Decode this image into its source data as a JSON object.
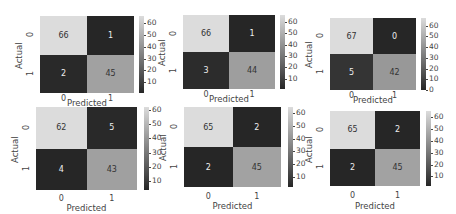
{
  "chart_data": [
    {
      "type": "heatmap",
      "title": "",
      "xlabel": "Predicted",
      "ylabel": "Actual",
      "x_ticks": [
        "0",
        "1"
      ],
      "y_ticks": [
        "0",
        "1"
      ],
      "values": [
        [
          66,
          1
        ],
        [
          2,
          45
        ]
      ],
      "colorbar_ticks": [
        "10",
        "20",
        "30",
        "40",
        "50",
        "60"
      ],
      "colorbar_range": [
        1,
        66
      ]
    },
    {
      "type": "heatmap",
      "title": "",
      "xlabel": "Predicted",
      "ylabel": "Actual",
      "x_ticks": [
        "0",
        "1"
      ],
      "y_ticks": [
        "0",
        "1"
      ],
      "values": [
        [
          66,
          1
        ],
        [
          3,
          44
        ]
      ],
      "colorbar_ticks": [
        "10",
        "20",
        "30",
        "40",
        "50",
        "60"
      ],
      "colorbar_range": [
        1,
        66
      ]
    },
    {
      "type": "heatmap",
      "title": "",
      "xlabel": "Predicted",
      "ylabel": "Actual",
      "x_ticks": [
        "0",
        "1"
      ],
      "y_ticks": [
        "0",
        "1"
      ],
      "values": [
        [
          67,
          0
        ],
        [
          5,
          42
        ]
      ],
      "colorbar_ticks": [
        "0",
        "10",
        "20",
        "30",
        "40",
        "50",
        "60"
      ],
      "colorbar_range": [
        0,
        67
      ]
    },
    {
      "type": "heatmap",
      "title": "",
      "xlabel": "Predicted",
      "ylabel": "Actual",
      "x_ticks": [
        "0",
        "1"
      ],
      "y_ticks": [
        "0",
        "1"
      ],
      "values": [
        [
          62,
          5
        ],
        [
          4,
          43
        ]
      ],
      "colorbar_ticks": [
        "10",
        "20",
        "30",
        "40",
        "50",
        "60"
      ],
      "colorbar_range": [
        4,
        62
      ]
    },
    {
      "type": "heatmap",
      "title": "",
      "xlabel": "Predicted",
      "ylabel": "Actual",
      "x_ticks": [
        "0",
        "1"
      ],
      "y_ticks": [
        "0",
        "1"
      ],
      "values": [
        [
          65,
          2
        ],
        [
          2,
          45
        ]
      ],
      "colorbar_ticks": [
        "10",
        "20",
        "30",
        "40",
        "50",
        "60"
      ],
      "colorbar_range": [
        2,
        65
      ]
    },
    {
      "type": "heatmap",
      "title": "",
      "xlabel": "Predicted",
      "ylabel": "Actual",
      "x_ticks": [
        "0",
        "1"
      ],
      "y_ticks": [
        "0",
        "1"
      ],
      "values": [
        [
          65,
          2
        ],
        [
          2,
          45
        ]
      ],
      "colorbar_ticks": [
        "10",
        "20",
        "30",
        "40",
        "50",
        "60"
      ],
      "colorbar_range": [
        2,
        65
      ]
    }
  ],
  "colors": {
    "colormap_low": "#262626",
    "colormap_high": "#dcdcdc"
  }
}
